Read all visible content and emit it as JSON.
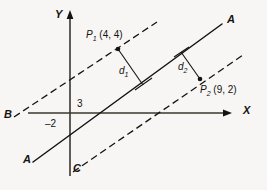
{
  "figure": {
    "type": "geometry-diagram",
    "background_color": "#f7f6f4",
    "ink_color": "#15130f",
    "axes": {
      "x_label": "X",
      "y_label": "Y",
      "origin_px": [
        70,
        113
      ]
    },
    "intercepts": {
      "x_intercept_label": "3",
      "y_intercept_label": "–2"
    },
    "lines": [
      {
        "name": "line-A",
        "style": "solid",
        "start_label": "A",
        "end_label": "A",
        "description": "central solid line through x-intercept 3 and y-intercept -2"
      },
      {
        "name": "line-B",
        "style": "dashed",
        "end_label": "B",
        "description": "upper parallel dashed line through P1"
      },
      {
        "name": "line-C",
        "style": "dashed",
        "end_label": "C",
        "description": "lower parallel dashed line through P2"
      }
    ],
    "points": [
      {
        "name": "P1",
        "label_main": "P",
        "label_sub": "1",
        "label_coords": "(4, 4)"
      },
      {
        "name": "P2",
        "label_main": "P",
        "label_sub": "2",
        "label_coords": "(9, 2)"
      }
    ],
    "distances": [
      {
        "name": "d1",
        "label_main": "d",
        "label_sub": "1"
      },
      {
        "name": "d2",
        "label_main": "d",
        "label_sub": "2"
      }
    ]
  }
}
